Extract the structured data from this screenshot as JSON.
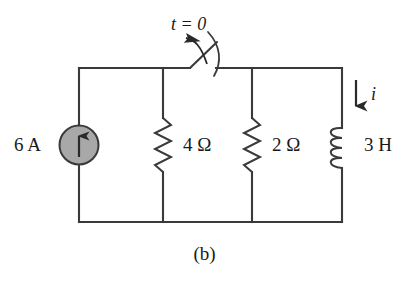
{
  "figure": {
    "caption": "(b)",
    "background_color": "#ffffff",
    "line_color": "#3a3a3a",
    "source_fill_color": "#a8a8a8"
  },
  "labels": {
    "switch_time": "t = 0",
    "current_source": "6 A",
    "resistor_1": "4 Ω",
    "resistor_2": "2 Ω",
    "inductor": "3 H",
    "current_arrow": "i"
  },
  "components": [
    {
      "name": "current-source",
      "type": "current-source",
      "label": "6 A",
      "value": 6,
      "unit": "A",
      "direction": "up",
      "position": "left-branch"
    },
    {
      "name": "switch",
      "type": "switch",
      "label": "t = 0",
      "state": "closed-opens-at-t-0",
      "position": "top-rail"
    },
    {
      "name": "resistor-4-ohm",
      "type": "resistor",
      "label": "4 Ω",
      "value": 4,
      "unit": "Ω",
      "position": "second-branch"
    },
    {
      "name": "resistor-2-ohm",
      "type": "resistor",
      "label": "2 Ω",
      "value": 2,
      "unit": "Ω",
      "position": "third-branch"
    },
    {
      "name": "inductor-3-h",
      "type": "inductor",
      "label": "3 H",
      "value": 3,
      "unit": "H",
      "position": "right-branch"
    },
    {
      "name": "current-arrow",
      "type": "current-arrow",
      "label": "i",
      "direction": "down",
      "position": "right-branch-top"
    }
  ]
}
